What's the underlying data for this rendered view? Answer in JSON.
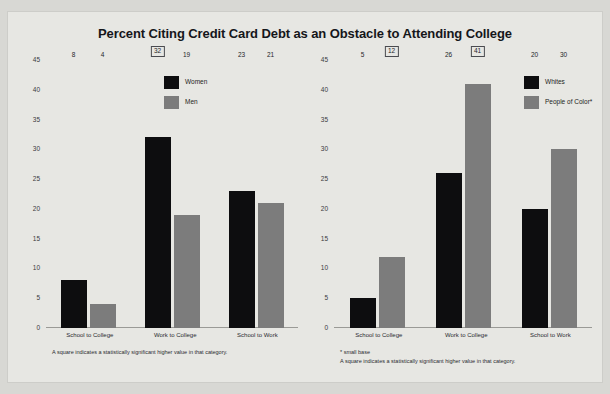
{
  "title": "Percent Citing Credit Card Debt as an Obstacle to Attending College",
  "chart_data": [
    {
      "type": "bar",
      "title": "Percent Citing Credit Card Debt as an Obstacle to Attending College",
      "panel": "left",
      "xlabel": "",
      "ylabel": "",
      "ylim": [
        0,
        45
      ],
      "yticks": [
        45,
        40,
        35,
        30,
        25,
        20,
        15,
        10,
        5,
        0
      ],
      "grid": false,
      "legend_position": "top-center",
      "categories": [
        "School to College",
        "Work to College",
        "School to Work"
      ],
      "series": [
        {
          "name": "Women",
          "color": "#0d0d0f",
          "values": [
            8,
            32,
            23
          ],
          "significant": [
            false,
            true,
            false
          ]
        },
        {
          "name": "Men",
          "color": "#7c7c7c",
          "values": [
            4,
            19,
            21
          ],
          "significant": [
            false,
            false,
            false
          ]
        }
      ],
      "annotations": [
        "A square indicates a statistically significant higher value in that category."
      ]
    },
    {
      "type": "bar",
      "title": "Percent Citing Credit Card Debt as an Obstacle to Attending College",
      "panel": "right",
      "xlabel": "",
      "ylabel": "",
      "ylim": [
        0,
        45
      ],
      "yticks": [
        45,
        40,
        35,
        30,
        25,
        20,
        15,
        10,
        5,
        0
      ],
      "grid": false,
      "legend_position": "top-right",
      "categories": [
        "School to College",
        "Work to College",
        "School to Work"
      ],
      "series": [
        {
          "name": "Whites",
          "color": "#0d0d0f",
          "values": [
            5,
            26,
            20
          ],
          "significant": [
            false,
            false,
            false
          ]
        },
        {
          "name": "People of Color*",
          "color": "#7c7c7c",
          "values": [
            12,
            41,
            30
          ],
          "significant": [
            true,
            true,
            false
          ]
        }
      ],
      "annotations": [
        "* small base",
        "A square indicates a statistically significant higher value in that category."
      ]
    }
  ]
}
